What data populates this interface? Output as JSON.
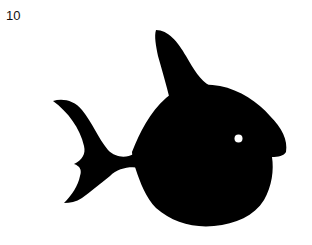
{
  "label": "10",
  "figure": {
    "fill_color": "#000000",
    "eye_color": "#ffffff",
    "background": "#ffffff"
  }
}
